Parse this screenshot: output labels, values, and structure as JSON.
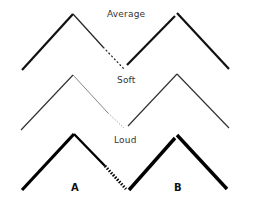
{
  "diagram": {
    "rows": [
      {
        "label": "Average",
        "stroke": "#111111",
        "width_a": 2.2,
        "width_a_down": 1.2,
        "width_b": 2.2
      },
      {
        "label": "Soft",
        "stroke": "#333333",
        "width_a": 1.2,
        "width_a_down": 0.8,
        "width_b": 1.2
      },
      {
        "label": "Loud",
        "stroke": "#000000",
        "width_a": 3.2,
        "width_a_down": 2.4,
        "width_b": 3.4
      }
    ],
    "wave_labels": [
      "A",
      "B"
    ]
  }
}
